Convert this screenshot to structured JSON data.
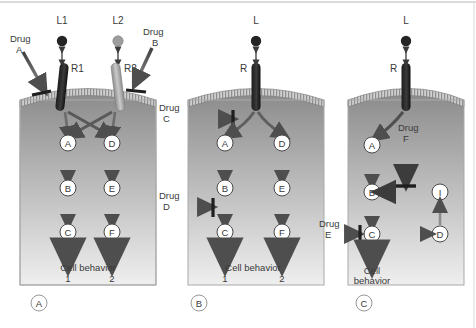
{
  "figure": {
    "type": "biological-signalling-diagram",
    "panels": [
      {
        "id": "A",
        "panel_label": "A",
        "ligands": [
          {
            "name": "L1",
            "shade": "dark",
            "color": "#2a2a2a"
          },
          {
            "name": "L2",
            "shade": "light",
            "color": "#9a9a9a"
          }
        ],
        "receptors": [
          {
            "name": "R1",
            "shade": "dark",
            "color": "#2a2a2a"
          },
          {
            "name": "R2",
            "shade": "light",
            "color": "#a8a8a8"
          }
        ],
        "drugs": [
          {
            "name": "Drug",
            "sub": "A",
            "action": "inhibit",
            "target": "R1"
          },
          {
            "name": "Drug",
            "sub": "B",
            "action": "inhibit",
            "target": "R2"
          }
        ],
        "nodes": [
          "A",
          "B",
          "C",
          "D",
          "E",
          "F"
        ],
        "edges": [
          {
            "from": "R1",
            "to": "A",
            "kind": "activate"
          },
          {
            "from": "R1",
            "to": "D",
            "kind": "activate"
          },
          {
            "from": "R2",
            "to": "D",
            "kind": "activate"
          },
          {
            "from": "R2",
            "to": "A",
            "kind": "activate"
          },
          {
            "from": "A",
            "to": "B",
            "kind": "activate"
          },
          {
            "from": "B",
            "to": "C",
            "kind": "activate"
          },
          {
            "from": "C",
            "to": "behavior1",
            "kind": "activate"
          },
          {
            "from": "D",
            "to": "E",
            "kind": "activate"
          },
          {
            "from": "E",
            "to": "F",
            "kind": "activate"
          },
          {
            "from": "F",
            "to": "behavior2",
            "kind": "activate"
          }
        ],
        "outcome_label": "Cell behavior",
        "outcomes": [
          "1",
          "2"
        ]
      },
      {
        "id": "B",
        "panel_label": "B",
        "ligands": [
          {
            "name": "L",
            "shade": "dark",
            "color": "#2a2a2a"
          }
        ],
        "receptors": [
          {
            "name": "R",
            "shade": "dark",
            "color": "#2a2a2a"
          }
        ],
        "drugs": [
          {
            "name": "Drug",
            "sub": "C",
            "action": "inhibit",
            "target": "R-output"
          },
          {
            "name": "Drug",
            "sub": "D",
            "action": "inhibit",
            "target": "B-to-C"
          }
        ],
        "nodes": [
          "A",
          "B",
          "C",
          "D",
          "E",
          "F"
        ],
        "edges": [
          {
            "from": "R",
            "to": "A",
            "kind": "activate"
          },
          {
            "from": "R",
            "to": "D",
            "kind": "activate"
          },
          {
            "from": "A",
            "to": "B",
            "kind": "activate"
          },
          {
            "from": "B",
            "to": "C",
            "kind": "activate"
          },
          {
            "from": "C",
            "to": "behavior1",
            "kind": "activate"
          },
          {
            "from": "D",
            "to": "E",
            "kind": "activate"
          },
          {
            "from": "E",
            "to": "F",
            "kind": "activate"
          },
          {
            "from": "F",
            "to": "behavior2",
            "kind": "activate"
          }
        ],
        "outcome_label": "Cell behavior",
        "outcomes": [
          "1",
          "2"
        ]
      },
      {
        "id": "C",
        "panel_label": "C",
        "ligands": [
          {
            "name": "L",
            "shade": "dark",
            "color": "#2a2a2a"
          }
        ],
        "receptors": [
          {
            "name": "R",
            "shade": "dark",
            "color": "#2a2a2a"
          }
        ],
        "drugs": [
          {
            "name": "Drug",
            "sub": "F",
            "action": "inhibit",
            "target": "B"
          },
          {
            "name": "Drug",
            "sub": "E",
            "action": "inhibit",
            "target": "C"
          }
        ],
        "nodes": [
          "A",
          "B",
          "C",
          "D",
          "I"
        ],
        "edges": [
          {
            "from": "R",
            "to": "A",
            "kind": "activate"
          },
          {
            "from": "A",
            "to": "B",
            "kind": "activate"
          },
          {
            "from": "I",
            "to": "B",
            "kind": "activate"
          },
          {
            "from": "B",
            "to": "C",
            "kind": "activate"
          },
          {
            "from": "C",
            "to": "D",
            "kind": "activate"
          },
          {
            "from": "D",
            "to": "I",
            "kind": "activate"
          },
          {
            "from": "C",
            "to": "behavior",
            "kind": "activate"
          }
        ],
        "outcome_label_line1": "Cell",
        "outcome_label_line2": "behavior"
      }
    ],
    "colors": {
      "cell_top": "#8e8e8e",
      "cell_bottom": "#ededed",
      "membrane": "#bdbdbd",
      "arrow_dark": "#4a4a4a",
      "arrow_mid": "#6e6e6e",
      "node_fill": "#ffffff",
      "node_stroke": "#444444",
      "box_stroke": "#a9a9a9",
      "text": "#3a3a3a"
    }
  }
}
